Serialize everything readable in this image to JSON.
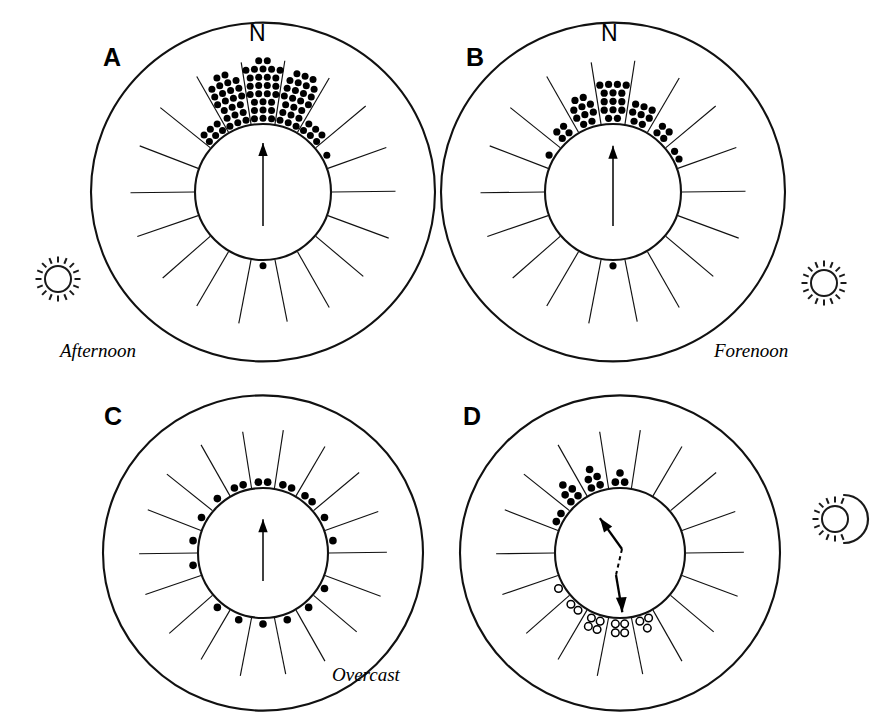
{
  "figure": {
    "ink_color": "#111111",
    "background_color": "#ffffff"
  },
  "panels": [
    {
      "id": "A",
      "letter": "A",
      "north_label": "N",
      "condition_label": "Afternoon",
      "sky_icon": "full-sun-icon",
      "sky_icon_side": "left",
      "mean_vector_direction_deg": 0,
      "mean_vector_length_rel": 0.72,
      "vector_type": "unimodal",
      "sector_count": 18,
      "sector_width_deg": 20,
      "sector_counts_by_deg": {
        "0": 28,
        "20": 24,
        "340": 23,
        "40": 6,
        "320": 6,
        "60": 1,
        "300": 0,
        "80": 0,
        "280": 0,
        "100": 0,
        "120": 0,
        "140": 0,
        "160": 0,
        "180": 1,
        "200": 0,
        "220": 0,
        "240": 0,
        "260": 0
      },
      "total_observations": 89
    },
    {
      "id": "B",
      "letter": "B",
      "north_label": "N",
      "condition_label": "Forenoon",
      "sky_icon": "full-sun-icon",
      "sky_icon_side": "right",
      "mean_vector_direction_deg": 0,
      "mean_vector_length_rel": 0.68,
      "vector_type": "unimodal",
      "sector_count": 18,
      "sector_width_deg": 20,
      "sector_counts_by_deg": {
        "0": 15,
        "340": 10,
        "20": 8,
        "320": 4,
        "40": 4,
        "60": 2,
        "300": 1,
        "80": 0,
        "280": 0,
        "100": 0,
        "120": 0,
        "140": 0,
        "160": 0,
        "180": 1,
        "200": 0,
        "220": 0,
        "240": 0,
        "260": 0
      },
      "total_observations": 45
    },
    {
      "id": "C",
      "letter": "C",
      "north_label": "",
      "condition_label": "Overcast",
      "sky_icon": "",
      "sky_icon_side": "",
      "mean_vector_direction_deg": 0,
      "mean_vector_length_rel": 0.52,
      "vector_type": "unimodal",
      "sector_count": 18,
      "sector_width_deg": 20,
      "sector_counts_by_deg": {
        "0": 2,
        "20": 2,
        "340": 2,
        "40": 2,
        "320": 1,
        "60": 1,
        "300": 1,
        "80": 1,
        "280": 1,
        "100": 0,
        "120": 1,
        "140": 1,
        "160": 1,
        "180": 1,
        "200": 1,
        "220": 1,
        "240": 0,
        "260": 1
      },
      "total_observations": 20
    },
    {
      "id": "D",
      "letter": "D",
      "north_label": "",
      "condition_label": "",
      "sky_icon": "sun-behind-cloud-icon",
      "sky_icon_side": "right",
      "mean_vector_direction_deg": 330,
      "mean_vector_length_rel": 0.62,
      "vector_type": "axial-bimodal",
      "axial_second_direction_deg": 172,
      "sector_count": 18,
      "sector_width_deg": 20,
      "sector_counts_by_deg": {
        "340": 5,
        "320": 5,
        "0": 3,
        "300": 2,
        "180": 4,
        "200": 4,
        "160": 3,
        "220": 2,
        "240": 1,
        "20": 0,
        "40": 0,
        "60": 0,
        "80": 0,
        "100": 0,
        "120": 0,
        "140": 0,
        "260": 0,
        "280": 0
      },
      "filled_marker_sectors_deg": [
        300,
        320,
        340,
        0
      ],
      "open_marker_sectors_deg": [
        160,
        180,
        200,
        220,
        240
      ],
      "total_observations": 29
    }
  ],
  "legend": {
    "filled_dot_meaning": "single observation",
    "open_dot_meaning": "single observation, reversed group"
  },
  "chart_data": {
    "type": "scatter",
    "title": "",
    "xlabel": "",
    "ylabel": "",
    "subcharts": [
      {
        "panel": "A",
        "label": "Afternoon",
        "type": "circular-histogram",
        "bin_width_deg": 20,
        "directions_deg": [
          0,
          20,
          340,
          40,
          320,
          60,
          180
        ],
        "counts": [
          28,
          24,
          23,
          6,
          6,
          1,
          1
        ],
        "mean_vector_deg": 0,
        "mean_vector_r": 0.72
      },
      {
        "panel": "B",
        "label": "Forenoon",
        "type": "circular-histogram",
        "bin_width_deg": 20,
        "directions_deg": [
          0,
          340,
          20,
          320,
          40,
          60,
          300,
          180
        ],
        "counts": [
          15,
          10,
          8,
          4,
          4,
          2,
          1,
          1
        ],
        "mean_vector_deg": 0,
        "mean_vector_r": 0.68
      },
      {
        "panel": "C",
        "label": "Overcast",
        "type": "circular-histogram",
        "bin_width_deg": 20,
        "directions_deg": [
          0,
          20,
          340,
          40,
          320,
          60,
          300,
          80,
          280,
          120,
          140,
          160,
          180,
          200,
          220,
          260
        ],
        "counts": [
          2,
          2,
          2,
          2,
          1,
          1,
          1,
          1,
          1,
          1,
          1,
          1,
          1,
          1,
          1,
          1
        ],
        "mean_vector_deg": 0,
        "mean_vector_r": 0.52
      },
      {
        "panel": "D",
        "label": "",
        "type": "circular-histogram",
        "bin_width_deg": 20,
        "directions_deg": [
          340,
          320,
          0,
          300,
          180,
          200,
          160,
          220,
          240
        ],
        "counts": [
          5,
          5,
          3,
          2,
          4,
          4,
          3,
          2,
          1
        ],
        "mean_vector_deg": 330,
        "mean_vector_r": 0.62,
        "axial_second_deg": 172
      }
    ]
  }
}
